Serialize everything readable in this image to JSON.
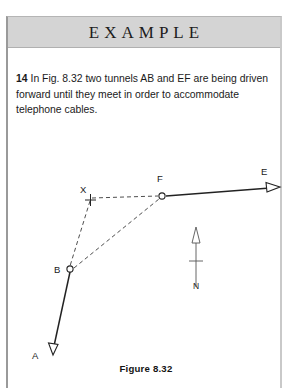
{
  "banner": {
    "title": "EXAMPLE"
  },
  "question": {
    "number": "14",
    "text": "In Fig. 8.32 two tunnels AB and EF are being driven forward until they meet in order to accommodate telephone cables."
  },
  "figure": {
    "caption": "Figure 8.32",
    "north_label": "N",
    "points": [
      {
        "id": "A",
        "label": "A",
        "x": 45,
        "y": 239,
        "label_x": 24,
        "label_y": 241,
        "marker": "arrowhead"
      },
      {
        "id": "B",
        "label": "B",
        "x": 62,
        "y": 155,
        "label_x": 47,
        "label_y": 156,
        "marker": "circle"
      },
      {
        "id": "X",
        "label": "X",
        "x": 82,
        "y": 83,
        "label_x": 73,
        "label_y": 76,
        "marker": "cross"
      },
      {
        "id": "F",
        "label": "F",
        "x": 154,
        "y": 81,
        "label_x": 149,
        "label_y": 66,
        "marker": "circle"
      },
      {
        "id": "E",
        "label": "E",
        "x": 269,
        "y": 72,
        "label_x": 255,
        "label_y": 60,
        "marker": "arrowhead"
      }
    ],
    "lines": [
      {
        "from": "B",
        "to": "A",
        "style": "solid",
        "name": "tunnel-AB"
      },
      {
        "from": "F",
        "to": "E",
        "style": "solid",
        "name": "tunnel-EF"
      },
      {
        "from": "X",
        "to": "F",
        "style": "dashed",
        "name": "sightline-XF"
      },
      {
        "from": "X",
        "to": "B",
        "style": "dashed",
        "name": "sightline-XB"
      },
      {
        "from": "B",
        "to": "F",
        "style": "dashed",
        "name": "sightline-BF"
      }
    ]
  },
  "colors": {
    "banner_bg": "#d4d4d4",
    "ink": "#1a1a1a",
    "line": "#3a3a3a",
    "border": "#9a9a9a"
  }
}
